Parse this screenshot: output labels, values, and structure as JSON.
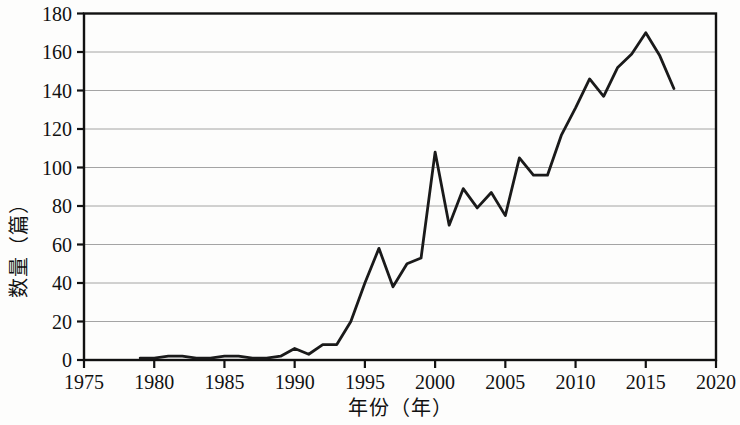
{
  "chart_data": {
    "type": "line",
    "title": "",
    "xlabel": "年份（年）",
    "ylabel": "数量（篇）",
    "xlim": [
      1975,
      2020
    ],
    "ylim": [
      0,
      180
    ],
    "xticks": [
      1975,
      1980,
      1985,
      1990,
      1995,
      2000,
      2005,
      2010,
      2015,
      2020
    ],
    "yticks": [
      0,
      20,
      40,
      60,
      80,
      100,
      120,
      140,
      160,
      180
    ],
    "grid": "horizontal",
    "legend": "none",
    "line_color": "#1a1a1a",
    "x": [
      1979,
      1980,
      1981,
      1982,
      1983,
      1984,
      1985,
      1986,
      1987,
      1988,
      1989,
      1990,
      1991,
      1992,
      1993,
      1994,
      1995,
      1996,
      1997,
      1998,
      1999,
      2000,
      2001,
      2002,
      2003,
      2004,
      2005,
      2006,
      2007,
      2008,
      2009,
      2010,
      2011,
      2012,
      2013,
      2014,
      2015,
      2016,
      2017
    ],
    "values": [
      1,
      1,
      2,
      2,
      1,
      1,
      2,
      2,
      1,
      1,
      2,
      6,
      3,
      8,
      8,
      20,
      40,
      58,
      38,
      50,
      53,
      108,
      70,
      89,
      79,
      87,
      75,
      105,
      96,
      96,
      117,
      131,
      146,
      137,
      152,
      159,
      170,
      158,
      141
    ],
    "series": [
      {
        "name": "数量",
        "values": [
          1,
          1,
          2,
          2,
          1,
          1,
          2,
          2,
          1,
          1,
          2,
          6,
          3,
          8,
          8,
          20,
          40,
          58,
          38,
          50,
          53,
          108,
          70,
          89,
          79,
          87,
          75,
          105,
          96,
          96,
          117,
          131,
          146,
          137,
          152,
          159,
          170,
          158,
          141
        ]
      }
    ]
  }
}
